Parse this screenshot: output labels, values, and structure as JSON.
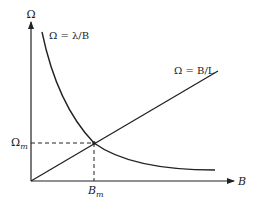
{
  "diagram": {
    "type": "intersection-plot",
    "axes": {
      "y_label": "Ω",
      "x_label": "B"
    },
    "curves": [
      {
        "name": "hyperbola",
        "equation_label": "Ω = λ/B"
      },
      {
        "name": "line",
        "equation_label": "Ω = B/L"
      }
    ],
    "intersection": {
      "omega_label": "Ω",
      "omega_subscript": "m",
      "b_label": "B",
      "b_subscript": "m"
    },
    "colors": {
      "stroke": "#222222",
      "background": "#ffffff"
    }
  }
}
